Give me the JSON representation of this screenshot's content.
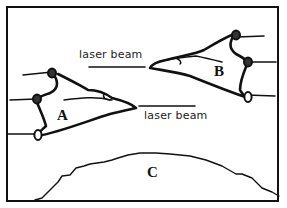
{
  "diagram": {
    "labels": {
      "laser_top": "laser beam",
      "laser_bottom": "laser beam",
      "ship_a": "A",
      "ship_b": "B",
      "planet": "C"
    },
    "colors": {
      "ink": "#111111",
      "background": "#ffffff"
    }
  }
}
